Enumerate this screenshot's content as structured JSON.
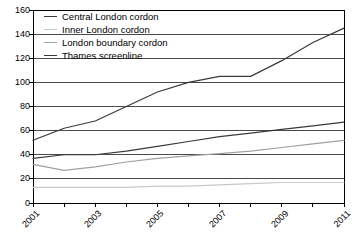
{
  "chart_data": {
    "type": "line",
    "title": "",
    "xlabel": "",
    "ylabel": "",
    "x": [
      2001,
      2002,
      2003,
      2004,
      2005,
      2006,
      2007,
      2008,
      2009,
      2010,
      2011
    ],
    "xlim": [
      2001,
      2011
    ],
    "ylim": [
      0,
      160
    ],
    "yticks": [
      0,
      20,
      40,
      60,
      80,
      100,
      120,
      140,
      160
    ],
    "xticks": [
      2001,
      2002,
      2003,
      2004,
      2005,
      2006,
      2007,
      2008,
      2009,
      2010,
      2011
    ],
    "xtick_labels_shown": [
      "2001",
      "2003",
      "2005",
      "2007",
      "2009",
      "2011"
    ],
    "grid": "horizontal",
    "legend_position": "top-left",
    "series": [
      {
        "name": "Central London cordon",
        "color": "#3a3a3a",
        "values": [
          52,
          62,
          68,
          80,
          92,
          100,
          105,
          105,
          118,
          133,
          145
        ]
      },
      {
        "name": "Inner London cordon",
        "color": "#c8c8c8",
        "values": [
          13,
          13,
          13,
          13,
          14,
          14,
          15,
          16,
          17,
          17,
          17
        ]
      },
      {
        "name": "London boundary cordon",
        "color": "#a0a0a0",
        "values": [
          32,
          27,
          30,
          34,
          37,
          39,
          41,
          43,
          46,
          49,
          52
        ]
      },
      {
        "name": "Thames screenline",
        "color": "#3a3a3a",
        "values": [
          37,
          40,
          40,
          43,
          47,
          51,
          55,
          58,
          61,
          64,
          67
        ]
      }
    ]
  },
  "axis": {
    "y_labels": [
      "160",
      "140",
      "120",
      "100",
      "80",
      "60",
      "40",
      "20",
      "0"
    ],
    "x_labels": [
      "2001",
      "2003",
      "2005",
      "2007",
      "2009",
      "2011"
    ]
  },
  "legend": {
    "items": [
      {
        "label": "Central London cordon"
      },
      {
        "label": "Inner London cordon"
      },
      {
        "label": "London boundary cordon"
      },
      {
        "label": "Thames screenline"
      }
    ]
  }
}
